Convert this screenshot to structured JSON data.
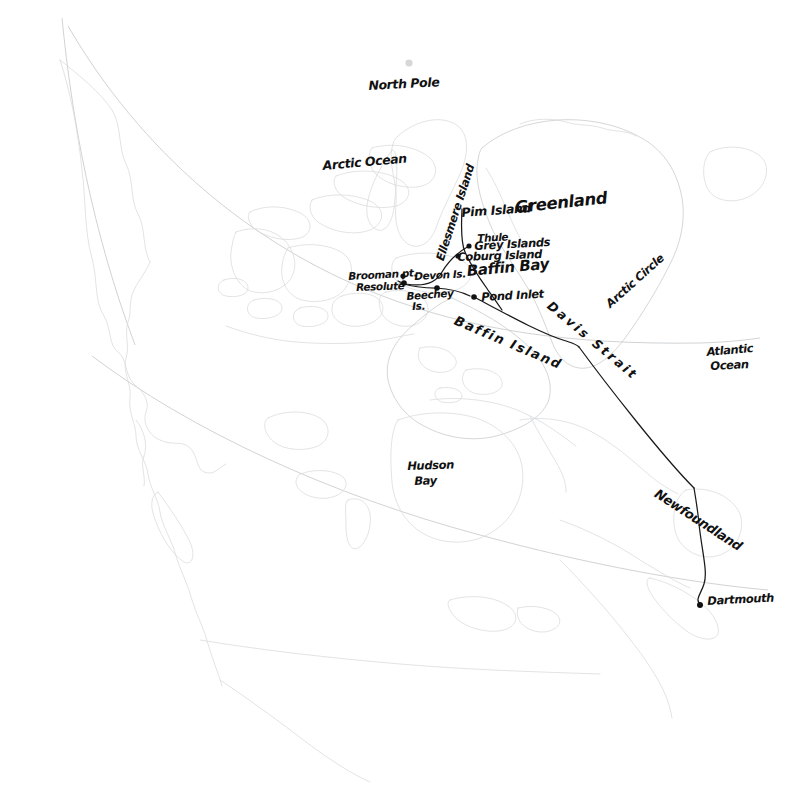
{
  "map": {
    "title": "Arctic expedition route map — Canadian Arctic, Greenland and Atlantic Canada",
    "style": "hand-drawn pen annotations over faint printed coastline",
    "colors": {
      "background": "#ffffff",
      "coastline": "#c9cbcd",
      "coastline_faint": "#d8dadc",
      "graticule": "#c4c6c9",
      "ink": "#1a1a1a",
      "pole_dot": "#d5d7d9"
    },
    "ocean_labels": [
      {
        "id": "north-pole",
        "text": "North Pole",
        "x": 368,
        "y": 78,
        "size": 12.5,
        "rot": -3
      },
      {
        "id": "arctic-ocean",
        "text": "Arctic Ocean",
        "x": 322,
        "y": 158,
        "size": 12.5,
        "rot": -5
      },
      {
        "id": "greenland",
        "text": "Greenland",
        "x": 514,
        "y": 198,
        "size": 16.5,
        "rot": -6
      },
      {
        "id": "baffin-bay",
        "text": "Baffin Bay",
        "x": 466,
        "y": 262,
        "size": 15.0,
        "rot": -5
      },
      {
        "id": "davis-strait",
        "text": "Davis Strait",
        "x": 554,
        "y": 298,
        "size": 13.0,
        "rot": 40,
        "spacing": 2.6
      },
      {
        "id": "arctic-circle",
        "text": "Arctic Circle",
        "x": 605,
        "y": 297,
        "size": 11.5,
        "rot": -42
      },
      {
        "id": "baffin-island",
        "text": "Baffin Island",
        "x": 460,
        "y": 313,
        "size": 13.0,
        "rot": 23,
        "spacing": 1.8
      },
      {
        "id": "hudson-bay-1",
        "text": "Hudson",
        "x": 407,
        "y": 459,
        "size": 11.5,
        "rot": -2
      },
      {
        "id": "hudson-bay-2",
        "text": "Bay",
        "x": 414,
        "y": 475,
        "size": 11.5,
        "rot": -2
      },
      {
        "id": "atlantic-1",
        "text": "Atlantic",
        "x": 706,
        "y": 346,
        "size": 11.5,
        "rot": -5
      },
      {
        "id": "atlantic-2",
        "text": "Ocean",
        "x": 710,
        "y": 360,
        "size": 11.5,
        "rot": -3
      },
      {
        "id": "ellesmere",
        "text": "Ellesmere Island",
        "x": 432,
        "y": 256,
        "size": 11.5,
        "rot": -72
      },
      {
        "id": "newfoundland",
        "text": "Newfoundland",
        "x": 662,
        "y": 487,
        "size": 13.0,
        "rot": 33
      }
    ],
    "places": [
      {
        "id": "pim-island",
        "label": "Pim Island",
        "lx": 461,
        "ly": 205,
        "dot": false
      },
      {
        "id": "thule",
        "label": "Thule",
        "lx": 477,
        "ly": 232,
        "dot": false
      },
      {
        "id": "grey-islands",
        "label": "Grey Islands",
        "lx": 474,
        "ly": 240,
        "dot": true,
        "dx": 469,
        "dy": 246
      },
      {
        "id": "coburg-island",
        "label": "Coburg Island",
        "lx": 461,
        "ly": 250,
        "dot": true,
        "dx": 458,
        "dy": 256
      },
      {
        "id": "brooman-pt",
        "label": "Brooman pt.",
        "lx": 348,
        "ly": 271,
        "dot": true,
        "dx": 403,
        "dy": 276
      },
      {
        "id": "resolute",
        "label": "Resolute",
        "lx": 354,
        "ly": 282,
        "dot": true,
        "dx": 404,
        "dy": 283
      },
      {
        "id": "devon-is",
        "label": "Devon Is.",
        "lx": 414,
        "ly": 271,
        "dot": false
      },
      {
        "id": "beechey-is-1",
        "label": "Beechey",
        "lx": 406,
        "ly": 291,
        "dot": true,
        "dx": 437,
        "dy": 288
      },
      {
        "id": "beechey-is-2",
        "label": "Is.",
        "lx": 411,
        "ly": 300,
        "dot": false
      },
      {
        "id": "pond-inlet",
        "label": "Pond Inlet",
        "lx": 481,
        "ly": 291,
        "dot": true,
        "dx": 474,
        "dy": 297
      },
      {
        "id": "dartmouth",
        "label": "Dartmouth",
        "lx": 707,
        "ly": 595,
        "dot": true,
        "dx": 700,
        "dy": 605
      }
    ],
    "route": {
      "name": "expedition-track",
      "description": "Track from Pim Island area south through Baffin Bay, west to Resolute/Brooman Point, then east across Davis Strait past Newfoundland to Dartmouth",
      "segments": [
        "M 462,210 C 461,238 462,250 468,258 C 477,272 486,286 500,306",
        "M 468,246 C 455,252 445,262 440,272 C 434,283 425,288 404,283 L 399,281",
        "M 404,283 C 412,285 424,288 437,288 C 452,289 466,293 474,297",
        "M 474,297 C 505,314 540,334 566,341 C 572,343 575,344 578,347",
        "M 578,347 C 600,378 660,455 692,487",
        "M 692,487 C 694,497 696,507 697,517 C 700,545 706,568 703,583 C 701,594 693,601 700,605"
      ]
    },
    "pole_marker": {
      "x": 409,
      "y": 63,
      "r": 3.5
    },
    "graticule_arcs": [
      {
        "id": "arctic-circle-arc",
        "d": "M 70,28 C 180,190 330,290 520,330 C 600,348 680,352 752,346"
      },
      {
        "id": "parallel-60-arc",
        "d": "M 88,356 C 200,430 360,500 520,545 C 620,572 700,585 760,590"
      },
      {
        "id": "meridian-arc",
        "d": "M 62,20 C 70,110 90,210 130,330"
      }
    ]
  }
}
